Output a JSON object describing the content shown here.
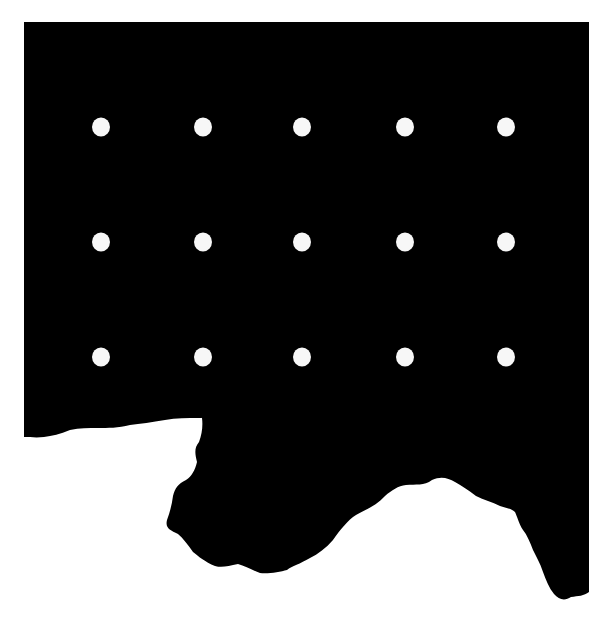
{
  "figure": {
    "background_color": "#ffffff",
    "shape_color": "#000000",
    "dot_color": "#f7f7f7",
    "grid": {
      "rows": 3,
      "cols": 5,
      "row_y": [
        127,
        242,
        357
      ],
      "col_x": [
        101,
        203,
        302,
        405,
        506
      ]
    }
  }
}
